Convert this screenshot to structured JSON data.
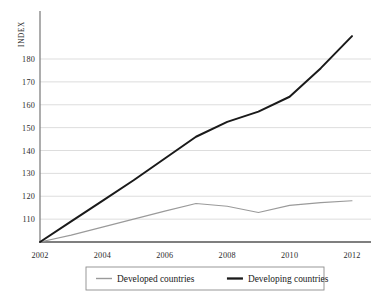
{
  "chart_data": {
    "type": "line",
    "title": "",
    "subtitle": "",
    "xlabel": "",
    "ylabel": "INDEX",
    "x": [
      2002,
      2003,
      2004,
      2005,
      2006,
      2007,
      2008,
      2009,
      2010,
      2011,
      2012
    ],
    "xtick_labels": [
      "2002",
      "2004",
      "2006",
      "2008",
      "2010",
      "2012"
    ],
    "xticks": [
      2002,
      2004,
      2006,
      2008,
      2010,
      2012
    ],
    "xlim": [
      2002,
      2012
    ],
    "ytick_labels": [
      "110",
      "120",
      "130",
      "140",
      "150",
      "160",
      "170",
      "180"
    ],
    "yticks": [
      110,
      120,
      130,
      140,
      150,
      160,
      170,
      180
    ],
    "ylim": [
      100,
      188
    ],
    "grid": true,
    "grid_axis": "y",
    "legend_position": "bottom",
    "series": [
      {
        "name": "Developed countries",
        "color": "#9a9a9a",
        "width": 1.1,
        "values": [
          100,
          103,
          106.5,
          110,
          113.5,
          116.8,
          115.6,
          112.9,
          116,
          117.2,
          118
        ]
      },
      {
        "name": "Developing countries",
        "color": "#1a1a1a",
        "width": 2.0,
        "values": [
          100,
          109,
          118,
          127,
          136.5,
          146,
          152.5,
          157,
          163.5,
          176,
          190
        ]
      }
    ]
  },
  "axes": {
    "y_axis_title": "INDEX"
  },
  "legend": {
    "items": [
      {
        "label": "Developed countries",
        "color": "#9a9a9a",
        "width": 1.1
      },
      {
        "label": "Developing countries",
        "color": "#1a1a1a",
        "width": 2.0
      }
    ]
  },
  "colors": {
    "developed": "#9a9a9a",
    "developing": "#1a1a1a",
    "grid": "#d9d9d9",
    "axis": "#808080",
    "background": "#ffffff"
  }
}
